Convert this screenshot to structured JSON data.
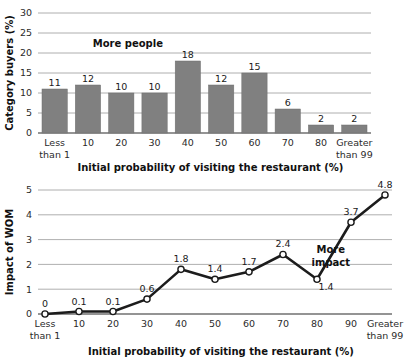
{
  "chart_data": [
    {
      "id": "top",
      "type": "bar",
      "title": "",
      "categories": [
        "Less\nthan 1",
        "10",
        "20",
        "30",
        "40",
        "50",
        "60",
        "70",
        "80",
        "Greater\nthan 99"
      ],
      "values": [
        11,
        12,
        10,
        10,
        18,
        12,
        15,
        6,
        2,
        2
      ],
      "value_labels": [
        "11",
        "12",
        "10",
        "10",
        "18",
        "12",
        "15",
        "6",
        "2",
        "2"
      ],
      "xlabel": "Initial probability of visiting the restaurant (%)",
      "ylabel": "Category buyers (%)",
      "ylim": [
        0,
        30
      ],
      "yticks": [
        0,
        5,
        10,
        15,
        20,
        25,
        30
      ],
      "ytick_labels": [
        "0",
        "5",
        "10",
        "15",
        "20",
        "25",
        "30"
      ],
      "grid": true,
      "legend": "none",
      "annotations": [
        {
          "text": "More people",
          "x_frac": 0.27,
          "y_value": 21.5
        }
      ],
      "bar_color": "#808080"
    },
    {
      "id": "bottom",
      "type": "line",
      "title": "",
      "categories": [
        "Less\nthan 1",
        "10",
        "20",
        "30",
        "40",
        "50",
        "60",
        "70",
        "80",
        "90",
        "Greater\nthan 99"
      ],
      "values": [
        0,
        0.1,
        0.1,
        0.6,
        1.8,
        1.4,
        1.7,
        2.4,
        1.4,
        3.7,
        4.8
      ],
      "value_labels": [
        "0",
        "0.1",
        "0.1",
        "0.6",
        "1.8",
        "1.4",
        "1.7",
        "2.4",
        "1.4",
        "3.7",
        "4.8"
      ],
      "label_below": [
        false,
        false,
        false,
        false,
        false,
        false,
        false,
        false,
        true,
        false,
        false
      ],
      "xlabel": "Initial probability of visiting the restaurant (%)",
      "ylabel": "Impact of WOM",
      "ylim": [
        0,
        5
      ],
      "yticks": [
        0,
        1,
        2,
        3,
        4,
        5
      ],
      "ytick_labels": [
        "0",
        "1",
        "2",
        "3",
        "4",
        "5"
      ],
      "grid": true,
      "legend": "none",
      "annotations": [
        {
          "text": "More",
          "x_frac": 0.8,
          "y_value": 2.45
        },
        {
          "text": "impact",
          "x_frac": 0.8,
          "y_value": 1.95
        }
      ],
      "line_color": "#1c1c1c",
      "marker_color": "#ffffff"
    }
  ]
}
